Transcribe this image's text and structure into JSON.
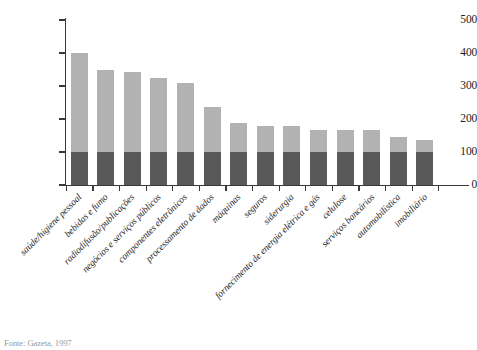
{
  "chart_data": {
    "type": "bar",
    "stacked": true,
    "title": "",
    "subtitle": "",
    "xlabel": "",
    "ylabel": "",
    "ylim": [
      0,
      500
    ],
    "yticks": [
      0,
      100,
      200,
      300,
      400,
      500
    ],
    "ytick_labels": [
      "0",
      "100",
      "200",
      "300",
      "400",
      "500"
    ],
    "grid": false,
    "legend": "none",
    "categories": [
      "saúde/higiene pessoal",
      "bebidas e fumo",
      "radiodifusão/publicações",
      "negócios e serviços públicos",
      "componentes eletrônicos",
      "processamento de dados",
      "máquinas",
      "seguros",
      "siderurgia",
      "fornecimento de energia elétrica e gás",
      "celulose",
      "serviços bancários",
      "automobilística",
      "imobiliário"
    ],
    "series": [
      {
        "name": "base",
        "color": "#595959",
        "values": [
          100,
          100,
          100,
          100,
          100,
          100,
          100,
          100,
          100,
          100,
          100,
          100,
          100,
          100
        ]
      },
      {
        "name": "upper",
        "color": "#b2b2b2",
        "values": [
          300,
          250,
          241,
          224,
          209,
          137,
          88,
          80,
          79,
          66,
          66,
          66,
          45,
          36
        ]
      }
    ],
    "totals": [
      400,
      350,
      341,
      324,
      309,
      237,
      188,
      180,
      179,
      166,
      166,
      166,
      145,
      136
    ]
  },
  "caption": {
    "source": "Fonte: Gazeta, 1997"
  },
  "colors": {
    "bar_top": "#b2b2b2",
    "bar_bottom": "#595959",
    "axis": "#3a3a3a",
    "text": "#1d1d1d",
    "background": "#ffffff"
  }
}
